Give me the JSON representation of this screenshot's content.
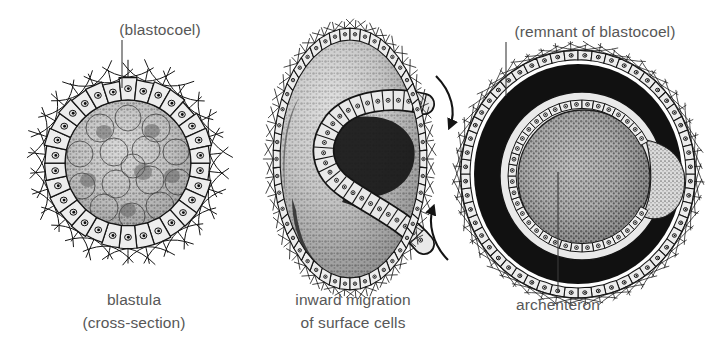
{
  "figure": {
    "kind": "biological-diagram",
    "background_color": "#ffffff",
    "ink_color": "#1a1a1a",
    "text_color": "#575757",
    "panel_count": 3
  },
  "panels": [
    {
      "id": "blastula",
      "caption_line1": "blastula",
      "caption_line2": "(cross-section)",
      "pointer_label": "(blastocoel)",
      "structure": "hollow ball of ciliated epithelial cells surrounding a fluid-filled cavity packed with rounded inner cells",
      "center_x": 128,
      "center_y": 163,
      "radius": 85,
      "cell_count": 30,
      "cilia_count": 30
    },
    {
      "id": "gastrula-invaginating",
      "caption_line1": "inward migration",
      "caption_line2": "of surface cells",
      "pointer_label": "",
      "structure": "ovoid embryo with an S-shaped sheet of surface cells folding inward from the right side",
      "center_x": 350,
      "center_y": 159,
      "radius_x": 72,
      "radius_y": 121,
      "cell_count": 46,
      "arrows": 2
    },
    {
      "id": "gastrula-archenteron",
      "caption_line1": "archenteron",
      "caption_line2": "",
      "pointer_label": "(remnant of blastocoel)",
      "structure": "later gastrula with a narrowed blastocoel remnant ring and a large internal archenteron cavity lined by epithelium",
      "center_x": 578,
      "center_y": 174,
      "radius_x": 110,
      "radius_y": 116,
      "cell_count": 52
    }
  ],
  "labels": [
    {
      "name": "blastocoel-label",
      "text": "(blastocoel)",
      "x": 160,
      "y": 21,
      "align": "center",
      "leader": {
        "x1": 122,
        "y1": 40,
        "x2": 122,
        "y2": 88
      }
    },
    {
      "name": "blastula-caption",
      "text": "blastula",
      "x": 134,
      "y": 291,
      "align": "center",
      "leader": null
    },
    {
      "name": "blastula-caption-sub",
      "text": "(cross-section)",
      "x": 134,
      "y": 314,
      "align": "center",
      "leader": null
    },
    {
      "name": "inward-migration-caption",
      "text": "inward migration",
      "x": 353,
      "y": 291,
      "align": "center",
      "leader": null
    },
    {
      "name": "inward-migration-caption-sub",
      "text": "of surface cells",
      "x": 353,
      "y": 314,
      "align": "center",
      "leader": null
    },
    {
      "name": "remnant-of-blastocoel-label",
      "text": "(remnant of blastocoel)",
      "x": 595,
      "y": 23,
      "align": "center",
      "leader": {
        "x1": 506,
        "y1": 42,
        "x2": 506,
        "y2": 96
      }
    },
    {
      "name": "archenteron-label",
      "text": "archenteron",
      "x": 558,
      "y": 296,
      "align": "center",
      "leader": {
        "x1": 558,
        "y1": 172,
        "x2": 558,
        "y2": 292
      }
    }
  ],
  "arrows": [
    {
      "name": "migration-arrow-top",
      "direction": "clockwise-inward (down-right)",
      "start_x": 436,
      "start_y": 78,
      "end_x": 450,
      "end_y": 128
    },
    {
      "name": "migration-arrow-bottom",
      "direction": "counter-clockwise-inward (up-left)",
      "start_x": 447,
      "start_y": 258,
      "end_x": 432,
      "end_y": 206
    }
  ]
}
